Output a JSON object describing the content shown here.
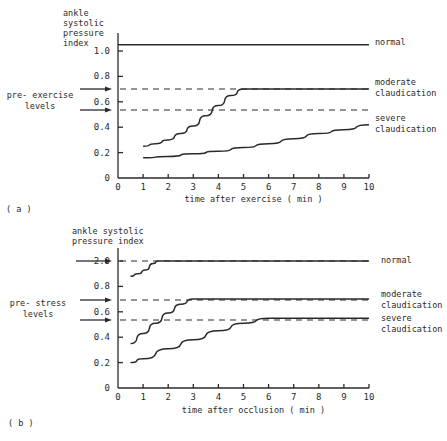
{
  "chart_data": [
    {
      "id": "a",
      "type": "line",
      "panel_label": "( a )",
      "ylabel_lines": [
        "ankle",
        "systolic",
        "pressure",
        "index"
      ],
      "xlabel": "time after exercise  ( min )",
      "x_ticks": [
        0,
        1,
        2,
        3,
        4,
        5,
        6,
        7,
        8,
        9,
        10
      ],
      "y_ticks": [
        {
          "label": "0",
          "value": 0
        },
        {
          "label": "0.2",
          "value": 0.2
        },
        {
          "label": "0.4",
          "value": 0.4
        },
        {
          "label": "0.6",
          "value": 0.6
        },
        {
          "label": "0.8",
          "value": 0.8
        },
        {
          "label": "1.0",
          "value": 1.0
        }
      ],
      "xlim": [
        0,
        10
      ],
      "ylim": [
        0,
        1.1
      ],
      "reference_label_lines": [
        "pre- exercise",
        "levels"
      ],
      "reference_levels": [
        0.7,
        0.54
      ],
      "series": [
        {
          "name": "normal",
          "label_lines": [
            "normal"
          ],
          "x": [
            0,
            10
          ],
          "y": [
            1.05,
            1.05
          ]
        },
        {
          "name": "moderate claudication",
          "label_lines": [
            "moderate",
            "claudication"
          ],
          "x": [
            1,
            1.5,
            2,
            2.5,
            3,
            3.5,
            4,
            4.5,
            5,
            6,
            7,
            8,
            9,
            10
          ],
          "y": [
            0.25,
            0.27,
            0.3,
            0.35,
            0.41,
            0.49,
            0.57,
            0.65,
            0.7,
            0.7,
            0.7,
            0.7,
            0.7,
            0.7
          ]
        },
        {
          "name": "severe claudication",
          "label_lines": [
            "severe",
            "claudication"
          ],
          "x": [
            1,
            2,
            3,
            4,
            5,
            6,
            7,
            8,
            9,
            10
          ],
          "y": [
            0.16,
            0.17,
            0.19,
            0.21,
            0.24,
            0.27,
            0.31,
            0.35,
            0.38,
            0.42
          ]
        }
      ]
    },
    {
      "id": "b",
      "type": "line",
      "panel_label": "( b )",
      "ylabel_lines": [
        "ankle systolic",
        "pressure index"
      ],
      "xlabel": "time after occlusion  ( min )",
      "x_ticks": [
        0,
        1,
        2,
        3,
        4,
        5,
        6,
        7,
        8,
        9,
        10
      ],
      "y_ticks": [
        {
          "label": "0",
          "value": 0
        },
        {
          "label": "0.2",
          "value": 0.2
        },
        {
          "label": "0.4",
          "value": 0.4
        },
        {
          "label": "0.6",
          "value": 0.6
        },
        {
          "label": "0.8",
          "value": 0.8
        },
        {
          "label": "2.0",
          "value": 1.0
        }
      ],
      "xlim": [
        0,
        10
      ],
      "ylim": [
        0,
        1.1
      ],
      "axis_note": "broken y-axis: top tick labelled 2.0",
      "reference_label_lines": [
        "pre- stress",
        "levels"
      ],
      "reference_levels": [
        1.0,
        0.7,
        0.55
      ],
      "series": [
        {
          "name": "normal",
          "label_lines": [
            "normal"
          ],
          "x": [
            0.5,
            0.8,
            1.1,
            1.4,
            1.6,
            10
          ],
          "y": [
            0.88,
            0.9,
            0.93,
            0.98,
            1.0,
            1.0
          ]
        },
        {
          "name": "moderate claudication",
          "label_lines": [
            "moderate",
            "claudication"
          ],
          "x": [
            0.5,
            1,
            1.5,
            2,
            2.5,
            3,
            10
          ],
          "y": [
            0.35,
            0.43,
            0.51,
            0.59,
            0.66,
            0.7,
            0.7
          ]
        },
        {
          "name": "severe claudication",
          "label_lines": [
            "severe",
            "claudication"
          ],
          "x": [
            0.5,
            1,
            2,
            3,
            4,
            5,
            6,
            10
          ],
          "y": [
            0.2,
            0.23,
            0.31,
            0.38,
            0.45,
            0.51,
            0.55,
            0.55
          ]
        }
      ]
    }
  ],
  "layout": {
    "panels": [
      {
        "x0": 118,
        "x1": 369,
        "y0": 178,
        "ytop": 51,
        "axis_top": 33,
        "label_x": 375,
        "label_ys": [
          45,
          85,
          121
        ],
        "ref_arrow_ys": [
          89,
          110
        ],
        "ref_text_x": 40,
        "ref_text_y": 98,
        "ylabel_x": 63,
        "ylabel_y": 16,
        "panel_label_xy": [
          6,
          212
        ],
        "xlabel_y": 202
      },
      {
        "x0": 118,
        "x1": 369,
        "y0": 388,
        "ytop": 261,
        "axis_top": 248,
        "label_x": 381,
        "label_ys": [
          263,
          297,
          321
        ],
        "ref_arrow_ys": [
          261,
          300,
          320
        ],
        "ref_text_x": 38,
        "ref_text_y": 306,
        "ylabel_x": 72,
        "ylabel_y": 234,
        "panel_label_xy": [
          8,
          426
        ],
        "xlabel_y": 413
      }
    ]
  }
}
